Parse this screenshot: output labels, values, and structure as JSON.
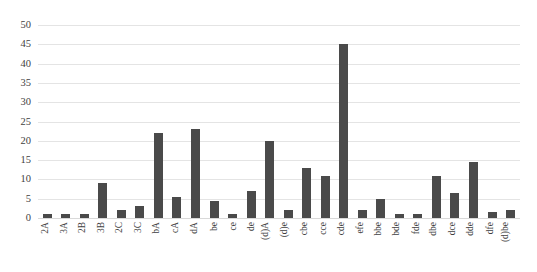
{
  "chart_data": {
    "type": "bar",
    "title": "",
    "subtitle": "",
    "xlabel": "",
    "ylabel": "",
    "ylim": [
      0,
      50
    ],
    "y_ticks": [
      0,
      5,
      10,
      15,
      20,
      25,
      30,
      35,
      40,
      45,
      50
    ],
    "grid": true,
    "legend": false,
    "legend_position": "none",
    "bar_color": "#4a4a4a",
    "grid_color": "#e4e4e4",
    "background_color": "#ffffff",
    "orientation": "vertical",
    "x_tick_rotation": 90,
    "categories": [
      "2A",
      "3A",
      "2B",
      "3B",
      "2C",
      "3C",
      "bA",
      "cA",
      "dA",
      "be",
      "ce",
      "de",
      "(d)A",
      "(d)e",
      "cbe",
      "cce",
      "cde",
      "efe",
      "bbe",
      "bde",
      "fde",
      "dbe",
      "dce",
      "dde",
      "dfe",
      "(d)be"
    ],
    "values": [
      1,
      1,
      1,
      9,
      2,
      3,
      22,
      5.5,
      23,
      4.5,
      1,
      7,
      20,
      2,
      13,
      11,
      45,
      2,
      5,
      1,
      1,
      11,
      6.5,
      14.5,
      1.5,
      2
    ]
  }
}
